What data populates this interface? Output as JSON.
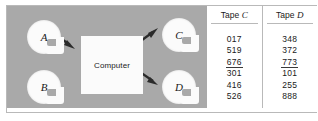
{
  "figure": {
    "panel_color": "#a9a9a9",
    "reel_color": "#fbfbfb",
    "border_color": "#b9b9b9"
  },
  "diagram": {
    "process_label": "Computer",
    "input_reels": [
      {
        "id": "A",
        "label": "A"
      },
      {
        "id": "B",
        "label": "B"
      }
    ],
    "output_reels": [
      {
        "id": "C",
        "label": "C"
      },
      {
        "id": "D",
        "label": "D"
      }
    ],
    "arrows": [
      {
        "from": "A",
        "to": "Computer"
      },
      {
        "from": "Computer",
        "to": "C"
      },
      {
        "from": "Computer",
        "to": "D"
      }
    ]
  },
  "table": {
    "columns": [
      {
        "head_prefix": "Tape",
        "head_letter": "C",
        "values": [
          "017",
          "519",
          "676",
          "301",
          "416",
          "526"
        ],
        "run_break_after_index": 2
      },
      {
        "head_prefix": "Tape",
        "head_letter": "D",
        "values": [
          "348",
          "372",
          "773",
          "101",
          "255",
          "888"
        ],
        "run_break_after_index": 2
      }
    ]
  }
}
